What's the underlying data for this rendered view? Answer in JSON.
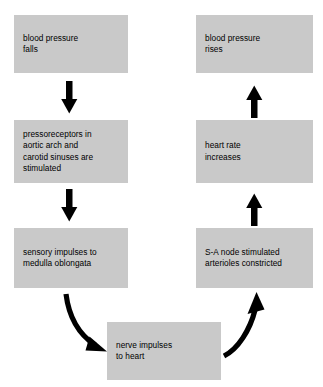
{
  "diagram": {
    "type": "flowchart",
    "background_color": "#ffffff",
    "node_fill_color": "#c9c9c9",
    "arrow_color": "#000000",
    "text_color": "#000000",
    "nodes": [
      {
        "id": "bp-falls",
        "label": "blood pressure\nfalls",
        "column": "left",
        "row": 1
      },
      {
        "id": "bp-rises",
        "label": "blood pressure\nrises",
        "column": "right",
        "row": 1
      },
      {
        "id": "pressorecept",
        "label": "pressoreceptors in\naortic arch and\ncarotid sinuses are\nstimulated",
        "column": "left",
        "row": 2
      },
      {
        "id": "heart-rate",
        "label": "heart rate\nincreases",
        "column": "right",
        "row": 2
      },
      {
        "id": "sensory",
        "label": "sensory impulses to\nmedulla oblongata",
        "column": "left",
        "row": 3
      },
      {
        "id": "sa-node",
        "label": "S-A node stimulated\narterioles constricted",
        "column": "right",
        "row": 3
      },
      {
        "id": "nerve-imp",
        "label": "nerve impulses\nto heart",
        "column": "center",
        "row": 4
      }
    ],
    "edges": [
      {
        "id": "edge-1",
        "from": "bp-falls",
        "to": "pressorecept",
        "style": "straight",
        "direction": "down"
      },
      {
        "id": "edge-2",
        "from": "pressorecept",
        "to": "sensory",
        "style": "straight",
        "direction": "down"
      },
      {
        "id": "edge-3",
        "from": "sensory",
        "to": "nerve-imp",
        "style": "curved",
        "direction": "down-right"
      },
      {
        "id": "edge-4",
        "from": "nerve-imp",
        "to": "sa-node",
        "style": "curved",
        "direction": "up-right"
      },
      {
        "id": "edge-5",
        "from": "sa-node",
        "to": "heart-rate",
        "style": "straight",
        "direction": "up"
      },
      {
        "id": "edge-6",
        "from": "heart-rate",
        "to": "bp-rises",
        "style": "straight",
        "direction": "up"
      }
    ]
  }
}
